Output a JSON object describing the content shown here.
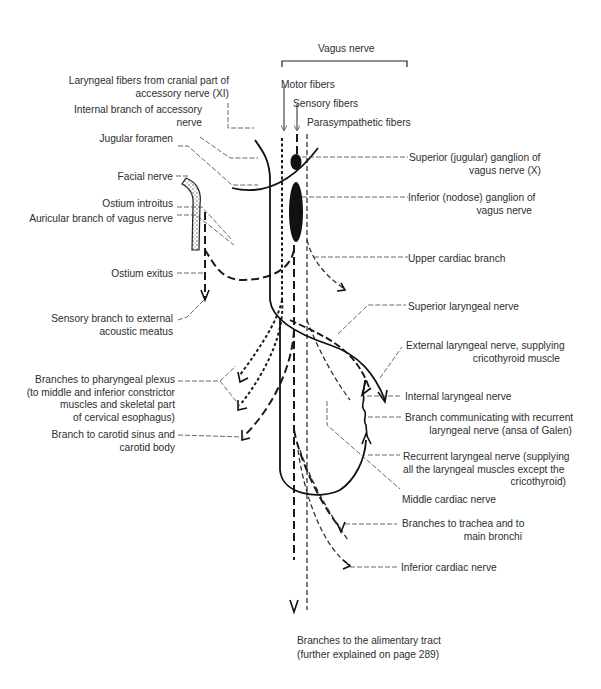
{
  "title": "Vagus nerve",
  "fiber_types": {
    "motor": "Motor fibers",
    "sensory": "Sensory fibers",
    "parasympathetic": "Parasympathetic fibers"
  },
  "labels_left": {
    "laryngeal_fibers": [
      "Laryngeal fibers from cranial part of",
      "accessory nerve (XI)"
    ],
    "internal_branch_accessory": [
      "Internal branch of accessory",
      "nerve"
    ],
    "jugular_foramen": "Jugular foramen",
    "facial_nerve": "Facial nerve",
    "ostium_introitus": "Ostium introitus",
    "auricular_branch": "Auricular branch of vagus nerve",
    "ostium_exitus": "Ostium exitus",
    "sensory_branch_meatus": [
      "Sensory branch to external",
      "acoustic meatus"
    ],
    "pharyngeal_plexus": [
      "Branches to pharyngeal plexus",
      "(to middle and inferior constrictor",
      "muscles and  skeletal part",
      "of cervical esophagus)"
    ],
    "carotid_sinus": [
      "Branch to carotid sinus and",
      "carotid body"
    ]
  },
  "labels_right": {
    "superior_ganglion": [
      "Superior (jugular) ganglion of",
      "vagus nerve (X)"
    ],
    "inferior_ganglion": [
      "Inferior (nodose) ganglion of",
      "vagus nerve"
    ],
    "upper_cardiac": "Upper cardiac branch",
    "superior_laryngeal": "Superior laryngeal nerve",
    "external_laryngeal": [
      "External laryngeal nerve, supplying",
      "cricothyroid muscle"
    ],
    "internal_laryngeal": "Internal laryngeal nerve",
    "ansa_galen": [
      "Branch communicating with recurrent",
      "laryngeal  nerve (ansa of Galen)"
    ],
    "recurrent_laryngeal": [
      "Recurrent laryngeal nerve (supplying",
      "all the laryngeal muscles except the",
      "cricothyroid)"
    ],
    "middle_cardiac": "Middle cardiac nerve",
    "trachea_bronchi": [
      "Branches to trachea and to",
      "main bronchi"
    ],
    "inferior_cardiac": "Inferior cardiac nerve"
  },
  "labels_bottom": {
    "alimentary": [
      "Branches to the alimentary tract",
      "(further explained on page 289)"
    ]
  },
  "legend": {
    "motor_line": "dotted (short dash)",
    "sensory_line": "long dash",
    "parasympathetic_line": "thin dash",
    "accessory_line": "solid"
  }
}
